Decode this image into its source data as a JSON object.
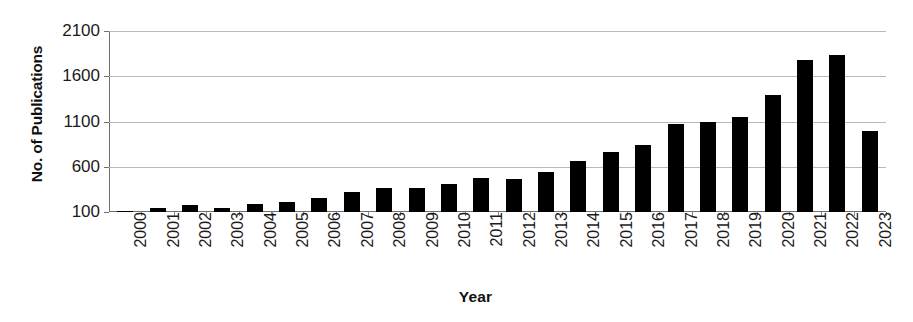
{
  "chart_data": {
    "type": "bar",
    "title": "",
    "xlabel": "Year",
    "ylabel": "No. of Publications",
    "categories": [
      "2000",
      "2001",
      "2002",
      "2003",
      "2004",
      "2005",
      "2006",
      "2007",
      "2008",
      "2009",
      "2010",
      "2011",
      "2012",
      "2013",
      "2014",
      "2015",
      "2016",
      "2017",
      "2018",
      "2019",
      "2020",
      "2021",
      "2022",
      "2023"
    ],
    "values": [
      115,
      140,
      180,
      145,
      190,
      215,
      250,
      320,
      360,
      360,
      410,
      480,
      470,
      545,
      665,
      760,
      840,
      1070,
      1100,
      1155,
      1390,
      1780,
      1830,
      990
    ],
    "ylim": [
      100,
      2100
    ],
    "yticks": [
      100,
      600,
      1100,
      1600,
      2100
    ],
    "ytick_labels": [
      "100",
      "600",
      "1100",
      "1600",
      "2100"
    ],
    "grid": true,
    "legend": false,
    "bar_color": "#000000",
    "grid_color": "#b9b9b9",
    "axis_color": "#6f6f6f",
    "xtick_rotation": 90
  },
  "axes": {
    "y_title": "No. of Publications",
    "x_title": "Year"
  }
}
